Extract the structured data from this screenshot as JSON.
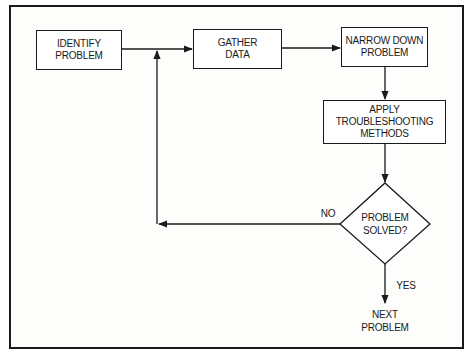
{
  "diagram": {
    "type": "flowchart",
    "nodes": {
      "identify": {
        "line1": "IDENTIFY",
        "line2": "PROBLEM",
        "shape": "rectangle"
      },
      "gather": {
        "line1": "GATHER",
        "line2": "DATA",
        "shape": "rectangle"
      },
      "narrow": {
        "line1": "NARROW DOWN",
        "line2": "PROBLEM",
        "shape": "rectangle"
      },
      "apply": {
        "line1": "APPLY",
        "line2": "TROUBLESHOOTING",
        "line3": "METHODS",
        "shape": "rectangle"
      },
      "decision": {
        "line1": "PROBLEM",
        "line2": "SOLVED?",
        "shape": "diamond"
      },
      "next": {
        "line1": "NEXT",
        "line2": "PROBLEM",
        "shape": "terminal-text"
      }
    },
    "edges": [
      {
        "from": "identify",
        "to": "gather",
        "label": ""
      },
      {
        "from": "gather",
        "to": "narrow",
        "label": ""
      },
      {
        "from": "narrow",
        "to": "apply",
        "label": ""
      },
      {
        "from": "apply",
        "to": "decision",
        "label": ""
      },
      {
        "from": "decision",
        "to": "gather",
        "label": "NO"
      },
      {
        "from": "decision",
        "to": "next",
        "label": "YES"
      }
    ],
    "edge_labels": {
      "no": "NO",
      "yes": "YES"
    },
    "colors": {
      "stroke": "#1a1a1a",
      "background": "#ffffff"
    }
  }
}
